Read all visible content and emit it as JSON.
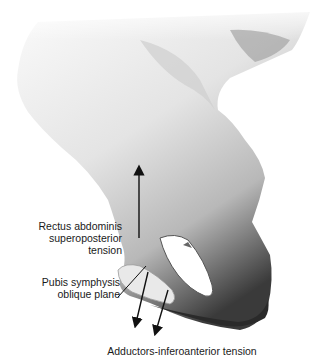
{
  "figure": {
    "colors": {
      "background": "#ffffff",
      "bone_light": "#f2f2f2",
      "bone_mid": "#bdbdbd",
      "bone_dark": "#2a2a2a",
      "arrow": "#111111"
    }
  },
  "labels": {
    "rectus": {
      "line1": "Rectus abdominis",
      "line2": "superoposterior",
      "line3": "tension"
    },
    "pubis": {
      "line1": "Pubis symphysis",
      "line2": "oblique plane"
    },
    "adductors": {
      "text": "Adductors-inferoanterior tension"
    }
  },
  "arrows": [
    {
      "name": "rectus-arrow",
      "direction": "up"
    },
    {
      "name": "adductor-arrow-1",
      "direction": "down"
    },
    {
      "name": "adductor-arrow-2",
      "direction": "down"
    }
  ]
}
